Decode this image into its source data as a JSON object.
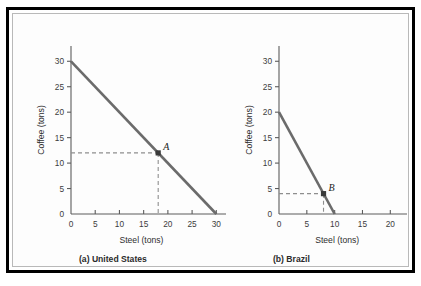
{
  "figure": {
    "border_color": "#000000",
    "inner_border_color": "#b9b9b9",
    "background": "#ffffff"
  },
  "chart_data": [
    {
      "type": "line",
      "id": "united-states",
      "title": "(a) United States",
      "caption_prefix": "(a)",
      "caption_name": "United States",
      "xlabel": "Steel (tons)",
      "ylabel": "Coffee (tons)",
      "xlim": [
        0,
        32
      ],
      "ylim": [
        0,
        33
      ],
      "xticks": [
        0,
        5,
        10,
        15,
        20,
        25,
        30
      ],
      "yticks": [
        0,
        5,
        10,
        15,
        20,
        25,
        30
      ],
      "xtick_labels": [
        "0",
        "5",
        "10",
        "15",
        "20",
        "25",
        "30"
      ],
      "ytick_labels": [
        "0",
        "5",
        "10",
        "15",
        "20",
        "25",
        "30"
      ],
      "grid": false,
      "legend": "none",
      "series": [
        {
          "name": "US production possibilities frontier",
          "x": [
            0,
            30
          ],
          "values": [
            30,
            0
          ],
          "color": "#6b6b6b"
        }
      ],
      "annotations": [
        {
          "label": "A",
          "x": 18,
          "y": 12,
          "marker": "square",
          "guides": "dashed-to-axes",
          "color": "#3a3a3a"
        }
      ]
    },
    {
      "type": "line",
      "id": "brazil",
      "title": "(b) Brazil",
      "caption_prefix": "(b)",
      "caption_name": "Brazil",
      "xlabel": "Steel (tons)",
      "ylabel": "Coffee (tons)",
      "xlim": [
        0,
        23
      ],
      "ylim": [
        0,
        33
      ],
      "xticks": [
        0,
        5,
        10,
        15,
        20
      ],
      "yticks": [
        0,
        5,
        10,
        15,
        20,
        25,
        30
      ],
      "xtick_labels": [
        "0",
        "5",
        "10",
        "15",
        "20"
      ],
      "ytick_labels": [
        "0",
        "5",
        "10",
        "15",
        "20",
        "25",
        "30"
      ],
      "grid": false,
      "legend": "none",
      "series": [
        {
          "name": "Brazil production possibilities frontier",
          "x": [
            0,
            10
          ],
          "values": [
            20,
            0
          ],
          "color": "#6b6b6b"
        }
      ],
      "annotations": [
        {
          "label": "B",
          "x": 8,
          "y": 4,
          "marker": "square",
          "guides": "dashed-to-axes",
          "color": "#3a3a3a"
        }
      ]
    }
  ]
}
